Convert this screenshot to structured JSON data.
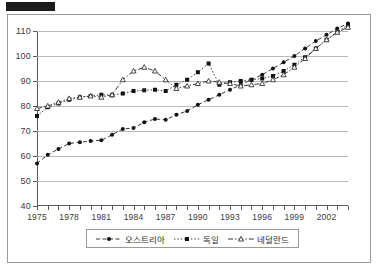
{
  "redaction": {
    "present": true
  },
  "legend": {
    "position": "bottom-center",
    "entries": [
      {
        "label": "오스트리아",
        "marker": "filled-circle",
        "line": "dashed"
      },
      {
        "label": "독일",
        "marker": "filled-square",
        "line": "dotted"
      },
      {
        "label": "네덜란드",
        "marker": "open-triangle",
        "line": "dash-dot"
      }
    ]
  },
  "chart_data": {
    "type": "line",
    "title": "",
    "xlabel": "",
    "ylabel": "",
    "grid": true,
    "xlim": [
      1975,
      2004
    ],
    "ylim": [
      40,
      110
    ],
    "yticks": [
      40,
      50,
      60,
      70,
      80,
      90,
      100,
      110
    ],
    "xticks": [
      1975,
      1978,
      1981,
      1984,
      1987,
      1990,
      1993,
      1996,
      1999,
      2002
    ],
    "x": [
      1975,
      1976,
      1977,
      1978,
      1979,
      1980,
      1981,
      1982,
      1983,
      1984,
      1985,
      1986,
      1987,
      1988,
      1989,
      1990,
      1991,
      1992,
      1993,
      1994,
      1995,
      1996,
      1997,
      1998,
      1999,
      2000,
      2001,
      2002,
      2003,
      2004
    ],
    "series": [
      {
        "name": "오스트리아",
        "marker": "filled-circle",
        "values": [
          57.0,
          60.5,
          62.8,
          65.0,
          65.5,
          66.0,
          66.3,
          68.5,
          70.8,
          71.2,
          73.5,
          74.8,
          74.5,
          76.5,
          78.0,
          80.5,
          82.5,
          84.5,
          86.5,
          88.5,
          90.5,
          92.5,
          95.0,
          97.5,
          100.0,
          103.0,
          106.0,
          108.5,
          111.0,
          113.0
        ]
      },
      {
        "name": "독일",
        "marker": "filled-square",
        "values": [
          76.0,
          79.5,
          81.0,
          82.5,
          83.5,
          84.0,
          84.5,
          84.3,
          85.0,
          86.0,
          86.3,
          86.5,
          86.0,
          88.5,
          90.5,
          93.5,
          97.0,
          88.5,
          89.5,
          90.0,
          90.5,
          91.0,
          92.0,
          94.0,
          96.5,
          99.5,
          103.0,
          106.5,
          109.5,
          112.5
        ]
      },
      {
        "name": "네덜란드",
        "marker": "open-triangle",
        "values": [
          79.0,
          80.0,
          81.5,
          83.0,
          83.5,
          84.0,
          83.5,
          84.5,
          90.5,
          94.0,
          95.5,
          94.0,
          90.5,
          87.0,
          88.0,
          89.0,
          90.0,
          89.5,
          89.0,
          88.0,
          88.5,
          89.0,
          90.5,
          92.5,
          95.5,
          99.0,
          103.0,
          106.5,
          109.5,
          111.5
        ]
      }
    ]
  }
}
